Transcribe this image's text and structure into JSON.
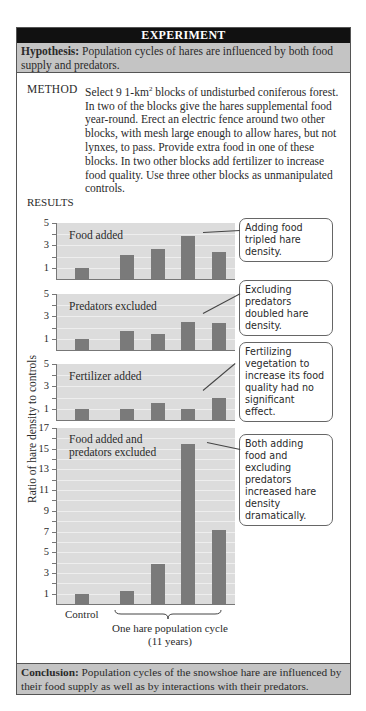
{
  "header": {
    "title": "EXPERIMENT"
  },
  "hypothesis": {
    "label": "Hypothesis:",
    "text": " Population cycles of hares are influenced by both food supply and predators."
  },
  "method": {
    "label": "METHOD",
    "text_before_sup": "Select 9 1-km",
    "sup": "2",
    "text_after_sup": " blocks of undisturbed coniferous forest. In two of the blocks give the hares supplemental food year-round. Erect an electric fence around two other blocks, with mesh large enough to allow hares, but not lynxes, to pass. Provide extra food in one of these blocks. In two other blocks add fertilizer to increase food quality. Use three other blocks as unmanipulated controls."
  },
  "results": {
    "label": "RESULTS",
    "ylabel": "Ratio of hare density to controls",
    "x_control_label": "Control",
    "x_cycle_label_1": "One hare population cycle",
    "x_cycle_label_2": "(11 years)"
  },
  "callouts": [
    "Adding food tripled hare density.",
    "Excluding predators doubled hare density.",
    "Fertilizing vegetation to increase its food quality had no significant effect.",
    "Both adding food and excluding predators increased hare density dramatically."
  ],
  "conclusion": {
    "label": "Conclusion:",
    "text": " Population cycles of the snowshoe hare are influenced by their food supply as well as by interactions with their predators."
  },
  "chart_data": [
    {
      "type": "bar",
      "title": "Food added",
      "categories": [
        "Control",
        "Cycle yr A",
        "Cycle yr B",
        "Cycle yr C",
        "Cycle yr D"
      ],
      "values": [
        1.0,
        2.1,
        2.7,
        3.8,
        2.4
      ],
      "ylim": [
        0,
        5
      ],
      "yticks": [
        1,
        3,
        5
      ],
      "ylabel": "Ratio of hare density to controls",
      "annotation": "Adding food tripled hare density."
    },
    {
      "type": "bar",
      "title": "Predators excluded",
      "categories": [
        "Control",
        "Cycle yr A",
        "Cycle yr B",
        "Cycle yr C",
        "Cycle yr D"
      ],
      "values": [
        1.0,
        1.7,
        1.4,
        2.5,
        2.4
      ],
      "ylim": [
        0,
        5
      ],
      "yticks": [
        1,
        3,
        5
      ],
      "annotation": "Excluding predators doubled hare density."
    },
    {
      "type": "bar",
      "title": "Fertilizer added",
      "categories": [
        "Control",
        "Cycle yr A",
        "Cycle yr B",
        "Cycle yr C",
        "Cycle yr D"
      ],
      "values": [
        1.0,
        1.0,
        1.5,
        1.0,
        2.0
      ],
      "ylim": [
        0,
        5
      ],
      "yticks": [
        1,
        3,
        5
      ],
      "annotation": "Fertilizing vegetation to increase its food quality had no significant effect."
    },
    {
      "type": "bar",
      "title": "Food added and predators excluded",
      "categories": [
        "Control",
        "Cycle yr A",
        "Cycle yr B",
        "Cycle yr C",
        "Cycle yr D"
      ],
      "values": [
        1.0,
        1.3,
        3.9,
        15.5,
        7.1
      ],
      "ylim": [
        0,
        17
      ],
      "yticks": [
        1,
        3,
        5,
        7,
        9,
        11,
        13,
        15,
        17
      ],
      "xlabel": "One hare population cycle (11 years)",
      "annotation": "Both adding food and excluding predators increased hare density dramatically."
    }
  ]
}
